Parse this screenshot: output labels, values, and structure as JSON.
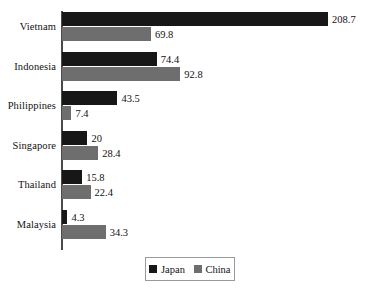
{
  "chart_data": {
    "type": "bar",
    "orientation": "horizontal",
    "grouped": true,
    "title": "",
    "subtitle": "",
    "xlabel": "",
    "ylabel": "",
    "grid": false,
    "xlim": [
      0,
      208.7
    ],
    "axis_line": "vertical category axis at left",
    "legend_position": "bottom-center",
    "categories": [
      "Vietnam",
      "Indonesia",
      "Philippines",
      "Singapore",
      "Thailand",
      "Malaysia"
    ],
    "series": [
      {
        "name": "Japan",
        "color": "#171717",
        "values": [
          208.7,
          74.4,
          43.5,
          20,
          15.8,
          4.3
        ],
        "value_labels": [
          "208.7",
          "74.4",
          "43.5",
          "20",
          "15.8",
          "4.3"
        ]
      },
      {
        "name": "China",
        "color": "#6e6e6e",
        "values": [
          69.8,
          92.8,
          7.4,
          28.4,
          22.4,
          34.3
        ],
        "value_labels": [
          "69.8",
          "92.8",
          "7.4",
          "28.4",
          "22.4",
          "34.3"
        ]
      }
    ]
  },
  "legend": {
    "entries": [
      {
        "label": "Japan",
        "color": "#171717"
      },
      {
        "label": "China",
        "color": "#6e6e6e"
      }
    ]
  },
  "colors": {
    "japan": "#171717",
    "china": "#6e6e6e",
    "axis": "#4a4a4a",
    "text": "#111111",
    "background": "#ffffff",
    "legend_border": "#9a9a9a"
  }
}
